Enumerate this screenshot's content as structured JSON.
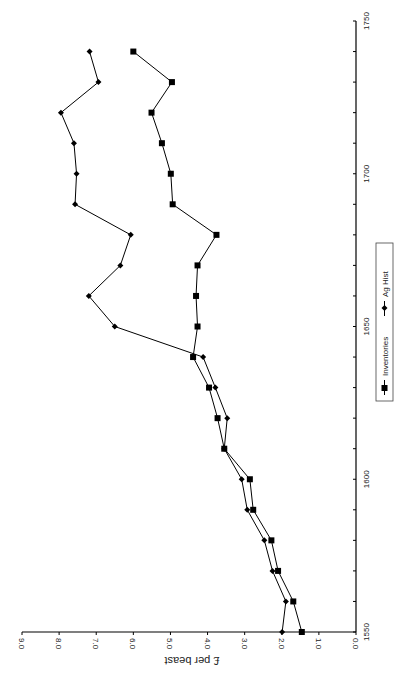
{
  "chart_data": {
    "type": "line",
    "title": "",
    "xlabel": "",
    "ylabel": "£ per beast",
    "orientation": "rotated 90° counter-clockwise (year axis vertical on right, value axis horizontal at bottom)",
    "x": [
      1550,
      1560,
      1570,
      1580,
      1590,
      1600,
      1610,
      1620,
      1630,
      1640,
      1650,
      1660,
      1670,
      1680,
      1690,
      1700,
      1710,
      1720,
      1730,
      1740
    ],
    "xlim": [
      1550,
      1750
    ],
    "ylim": [
      0,
      9
    ],
    "x_ticks": [
      "1550",
      "1600",
      "1650",
      "1700",
      "1750"
    ],
    "y_ticks": [
      "0.0",
      "1.0",
      "2.0",
      "3.0",
      "4.0",
      "5.0",
      "6.0",
      "7.0",
      "8.0",
      "9.0"
    ],
    "grid": false,
    "legend_position": "right",
    "series": [
      {
        "name": "Inventories",
        "marker": "square",
        "values": [
          1.46,
          1.69,
          2.1,
          2.28,
          2.77,
          2.86,
          3.55,
          3.73,
          3.96,
          4.39,
          4.27,
          4.31,
          4.27,
          3.76,
          4.94,
          4.99,
          5.23,
          5.51,
          4.96,
          6.0
        ]
      },
      {
        "name": "Ag Hist",
        "marker": "diamond",
        "values": [
          1.99,
          1.89,
          2.25,
          2.47,
          2.93,
          3.08,
          3.55,
          3.47,
          3.79,
          4.12,
          6.5,
          7.2,
          6.35,
          6.07,
          7.57,
          7.53,
          7.6,
          7.95,
          6.94,
          7.18
        ]
      }
    ]
  },
  "legend": {
    "items": [
      {
        "label": "Inventories",
        "marker": "square"
      },
      {
        "label": "Ag Hist",
        "marker": "diamond"
      }
    ]
  }
}
